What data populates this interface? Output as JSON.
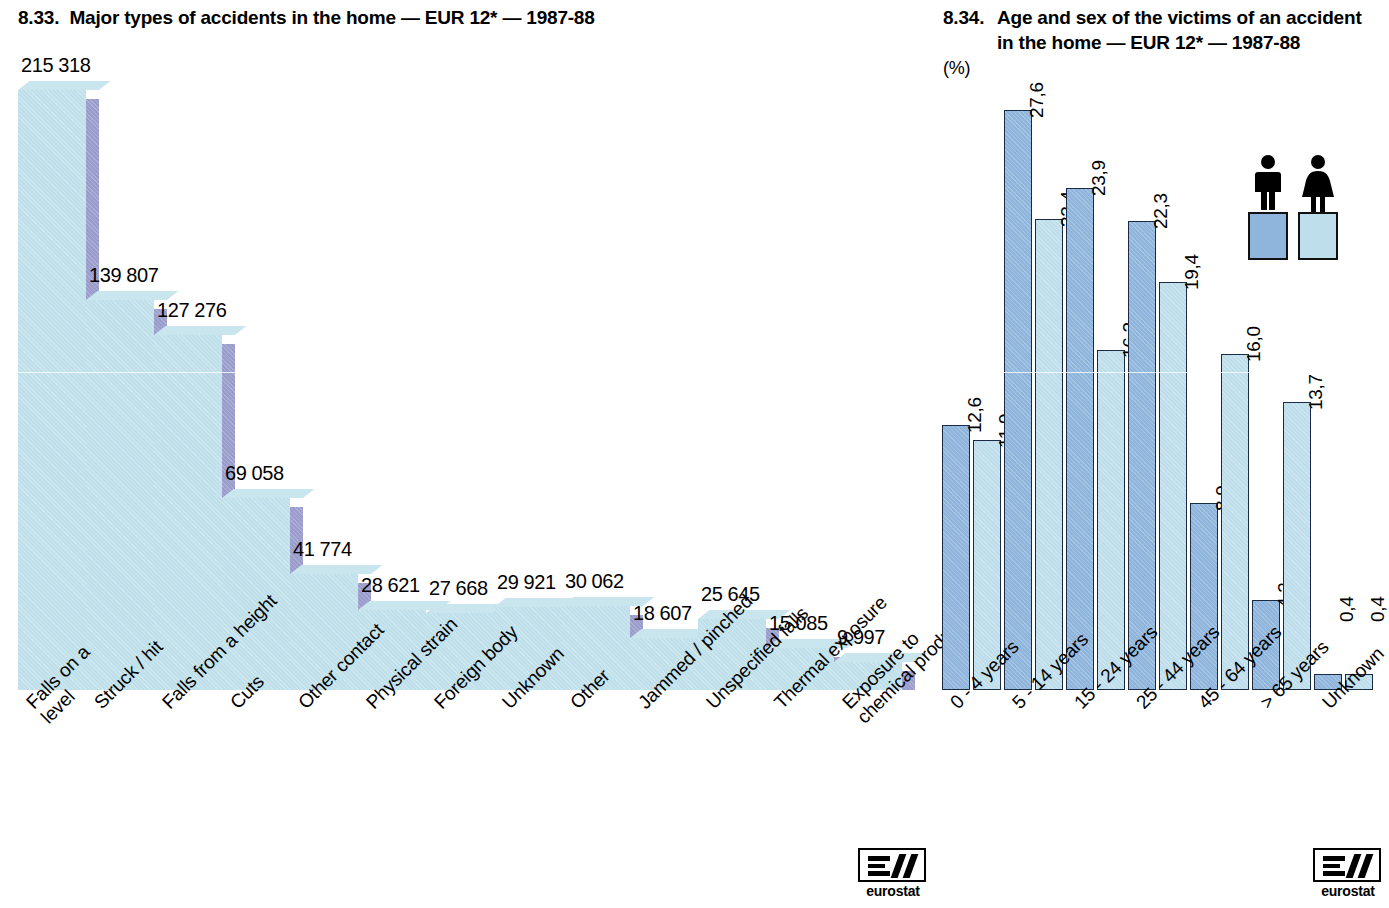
{
  "left": {
    "title": "8.33.  Major types of accidents in the home — EUR 12* — 1987-88",
    "logo": {
      "wordmark": "eurostat",
      "icon": "eurostat-logo-icon"
    }
  },
  "right": {
    "title_number": "8.34.",
    "title_text": "Age and sex of the victims of an accident in the home — EUR 12* — 1987-88",
    "title_unit": "(%)",
    "legend": {
      "male_label": "male-figure-icon",
      "female_label": "female-figure-icon",
      "male_color": "#8fb5dc",
      "female_color": "#bfdeec"
    },
    "logo": {
      "wordmark": "eurostat",
      "icon": "eurostat-logo-icon"
    }
  },
  "chart_data": [
    {
      "type": "bar",
      "id": "major-types-of-accidents",
      "title": "8.33.  Major types of accidents in the home — EUR 12* — 1987-88",
      "xlabel": "",
      "ylabel": "",
      "ylim": [
        0,
        215318
      ],
      "grid": false,
      "legend": "none",
      "orientation": "vertical",
      "bar_style": "3d-extruded",
      "colors": {
        "front": "#bfe0ea",
        "side": "#9a9ccb"
      },
      "categories": [
        "Falls on a\nlevel",
        "Struck / hit",
        "Falls from a height",
        "Cuts",
        "Other contact",
        "Physical strain",
        "Foreign body",
        "Unknown",
        "Other",
        "Jammed / pinched",
        "Unspecified falls",
        "Thermal exposure",
        "Exposure to\nchemical products"
      ],
      "values": [
        215318,
        139807,
        127276,
        69058,
        41774,
        28621,
        27668,
        29921,
        30062,
        18607,
        25645,
        15085,
        9997
      ],
      "value_labels": [
        "215 318",
        "139 807",
        "127 276",
        "69 058",
        "41 774",
        "28 621",
        "27 668",
        "29 921",
        "30 062",
        "18 607",
        "25 645",
        "15 085",
        "9 997"
      ]
    },
    {
      "type": "bar",
      "id": "age-and-sex-of-victims",
      "title": "8.34.  Age and sex of the victims of an accident in the home — EUR 12* — 1987-88 (%)",
      "xlabel": "",
      "ylabel": "%",
      "ylim": [
        0,
        27.6
      ],
      "grid": false,
      "legend_position": "top-right",
      "orientation": "vertical",
      "bar_style": "grouped-flat",
      "categories": [
        "0 - 4 years",
        "5 - 14 years",
        "15 - 24 years",
        "25 - 44 years",
        "45 - 64 years",
        "> 65 years",
        "Unknown"
      ],
      "series": [
        {
          "name": "male",
          "color": "#8fb5dc",
          "values": [
            12.6,
            27.6,
            23.9,
            22.3,
            8.9,
            4.3,
            0.4
          ],
          "value_labels": [
            "12,6",
            "27,6",
            "23,9",
            "22,3",
            "8,9",
            "4,3",
            "0,4"
          ]
        },
        {
          "name": "female",
          "color": "#bfdeec",
          "values": [
            11.9,
            22.4,
            16.2,
            19.4,
            16.0,
            13.7,
            0.4
          ],
          "value_labels": [
            "11,9",
            "22,4",
            "16,2",
            "19,4",
            "16,0",
            "13,7",
            "0,4"
          ]
        }
      ]
    }
  ]
}
